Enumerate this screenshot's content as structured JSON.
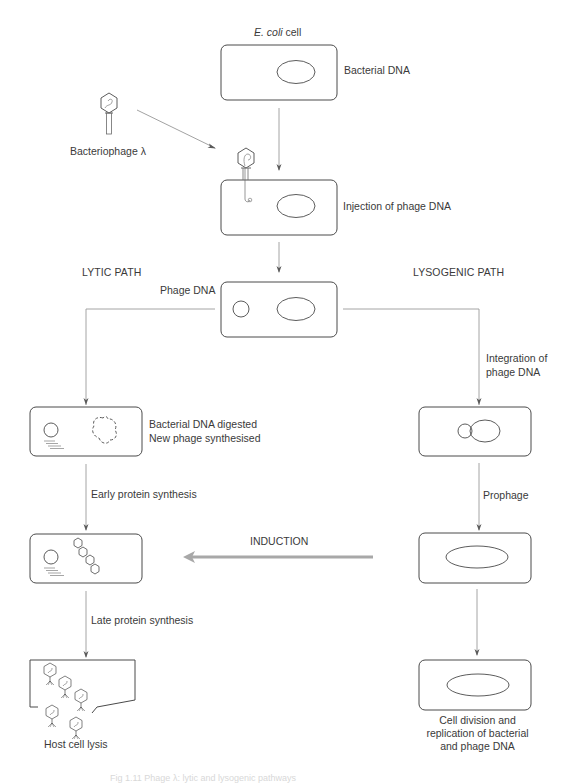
{
  "diagram": {
    "title_top": {
      "italic": "E. coli",
      "rest": " cell"
    },
    "bacteriophage_label": "Bacteriophage λ",
    "paths": {
      "lytic": "LYTIC PATH",
      "lysogenic": "LYSOGENIC PATH"
    },
    "labels": {
      "bacterial_dna": "Bacterial DNA",
      "injection": "Injection of phage DNA",
      "phage_dna": "Phage DNA",
      "integration_line1": "Integration of",
      "integration_line2": "phage DNA",
      "digested_line1": "Bacterial DNA digested",
      "digested_line2": "New phage synthesised",
      "early_protein": "Early protein synthesis",
      "late_protein": "Late protein synthesis",
      "host_lysis": "Host cell lysis",
      "prophage": "Prophage",
      "induction": "INDUCTION",
      "cell_division_line1": "Cell division and",
      "cell_division_line2": "replication of bacterial",
      "cell_division_line3": "and phage DNA"
    },
    "figure_caption": "Fig 1.11 Phage λ: lytic and lysogenic pathways",
    "colors": {
      "stroke": "#4a4a4a",
      "arrow_line": "#9a9a9a",
      "induction_arrow": "#a8a8a8",
      "text": "#3a3a3a"
    }
  }
}
